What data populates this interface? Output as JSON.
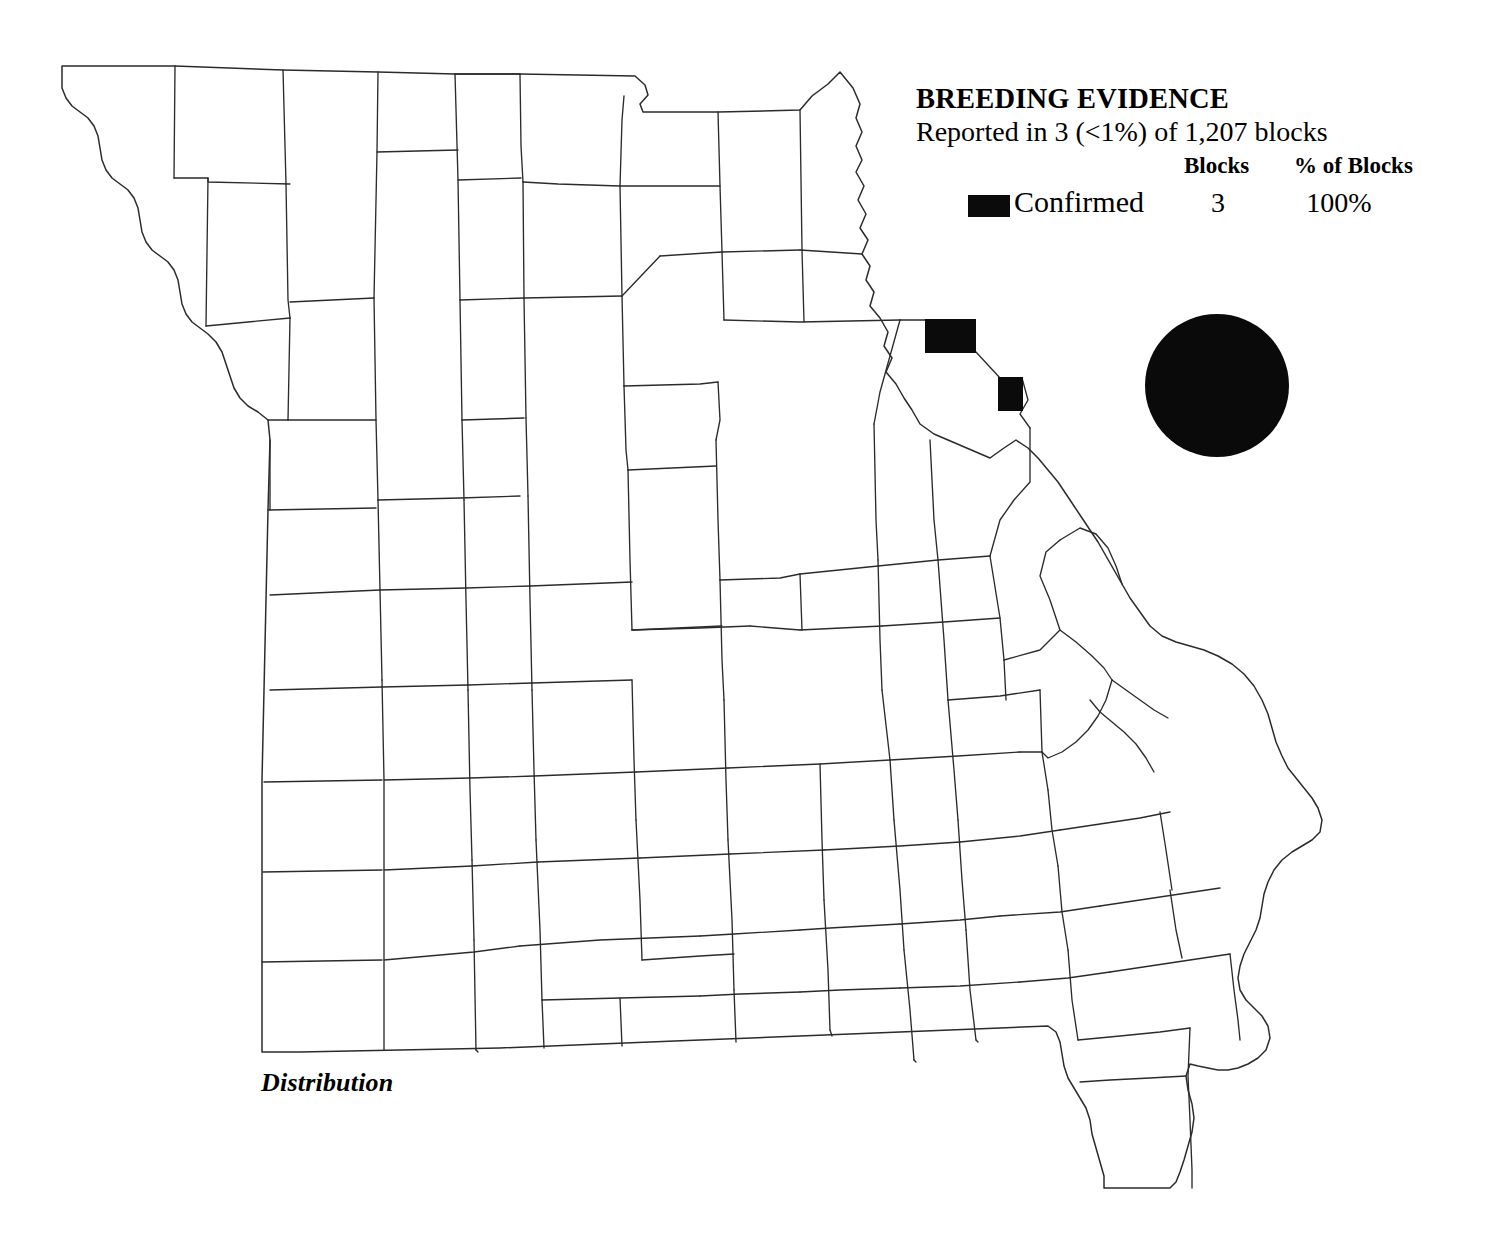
{
  "legend": {
    "title": "BREEDING EVIDENCE",
    "subtitle": "Reported in  3 (<1%) of 1,207 blocks",
    "column_headers": {
      "blocks": "Blocks",
      "percent_of_blocks": "% of Blocks"
    },
    "rows": [
      {
        "label": "Confirmed",
        "swatch_color": "#0b0b0b",
        "blocks": "3",
        "percent_of_blocks": "100%"
      }
    ]
  },
  "caption": "Distribution",
  "symbols": {
    "species_dot_color": "#0a0a0a",
    "species_dot_name": "filled-circle-symbol"
  },
  "map": {
    "region": "Missouri counties",
    "outline_color": "#2b2b2b",
    "fill_color": "#ffffff",
    "confirmed_block_color": "#0b0b0b",
    "confirmed_blocks": [
      {
        "x": 925,
        "y": 319,
        "w": 51,
        "h": 34
      },
      {
        "x": 998,
        "y": 377,
        "w": 25,
        "h": 34
      }
    ]
  }
}
